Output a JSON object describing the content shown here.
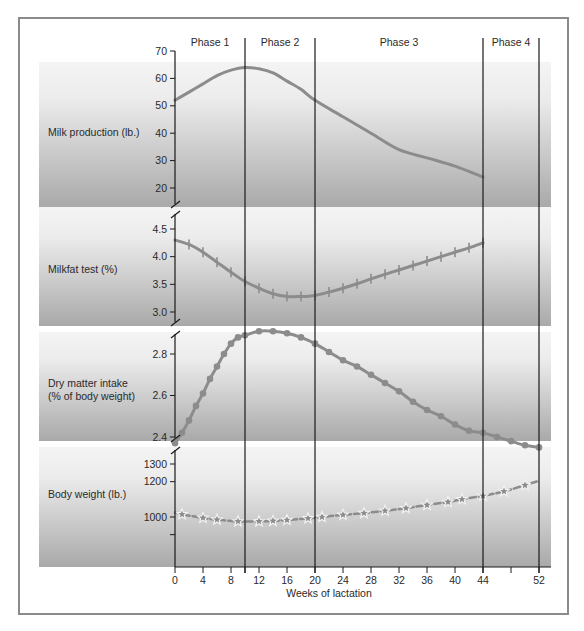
{
  "figure": {
    "x_axis_title": "Weeks of lactation",
    "phases": [
      {
        "label": "Phase 1",
        "start": 0,
        "end": 10
      },
      {
        "label": "Phase 2",
        "start": 10,
        "end": 20
      },
      {
        "label": "Phase 3",
        "start": 20,
        "end": 44
      },
      {
        "label": "Phase 4",
        "start": 44,
        "end": 52
      }
    ],
    "x_ticks": [
      0,
      4,
      8,
      12,
      16,
      20,
      24,
      28,
      32,
      36,
      40,
      44,
      52
    ],
    "panels": [
      {
        "label": "Milk production (lb.)",
        "y_ticks": [
          "70",
          "60",
          "50",
          "40",
          "30",
          "20"
        ]
      },
      {
        "label": "Milkfat test (%)",
        "y_ticks": [
          "4.5",
          "4.0",
          "3.5",
          "3.0"
        ]
      },
      {
        "label_line1": "Dry matter intake",
        "label_line2": "(% of body weight)",
        "y_ticks": [
          "2.8",
          "2.6",
          "2.4"
        ]
      },
      {
        "label": "Body weight (lb.)",
        "y_ticks": [
          "1300",
          "1200",
          "1000"
        ]
      }
    ]
  },
  "colors": {
    "line": "#8c8c8c",
    "axis": "#1a1a1a",
    "panel_top": "#f4f4f4",
    "panel_bottom": "#a9a9a9",
    "frame": "#8a8a8a"
  },
  "chart_data": [
    {
      "type": "line",
      "title": "Milk production (lb.)",
      "xlabel": "Weeks of lactation",
      "ylabel": "Milk production (lb.)",
      "ylim": [
        15,
        70
      ],
      "y_ticks": [
        20,
        30,
        40,
        50,
        60,
        70
      ],
      "marker": "none",
      "x": [
        0,
        2,
        4,
        6,
        8,
        10,
        12,
        14,
        16,
        18,
        20,
        24,
        28,
        32,
        36,
        40,
        44
      ],
      "values": [
        52,
        55,
        58,
        61,
        63,
        64,
        63.5,
        62,
        59,
        56,
        52,
        46,
        40,
        34,
        31,
        28,
        24
      ]
    },
    {
      "type": "line",
      "title": "Milkfat test (%)",
      "xlabel": "Weeks of lactation",
      "ylabel": "Milkfat test (%)",
      "ylim": [
        2.8,
        4.75
      ],
      "y_ticks": [
        3.0,
        3.5,
        4.0,
        4.5
      ],
      "marker": "cross",
      "x": [
        0,
        2,
        4,
        6,
        8,
        10,
        12,
        14,
        16,
        18,
        20,
        22,
        24,
        26,
        28,
        30,
        32,
        34,
        36,
        38,
        40,
        42,
        44
      ],
      "values": [
        4.3,
        4.22,
        4.08,
        3.9,
        3.72,
        3.55,
        3.43,
        3.33,
        3.28,
        3.28,
        3.3,
        3.36,
        3.43,
        3.51,
        3.6,
        3.68,
        3.76,
        3.84,
        3.92,
        4.0,
        4.08,
        4.16,
        4.25
      ]
    },
    {
      "type": "line",
      "title": "Dry matter intake (% of body weight)",
      "xlabel": "Weeks of lactation",
      "ylabel": "Dry matter intake (% of body weight)",
      "ylim": [
        2.33,
        2.95
      ],
      "y_ticks": [
        2.4,
        2.6,
        2.8
      ],
      "marker": "circle",
      "x": [
        0,
        1,
        2,
        3,
        4,
        5,
        6,
        7,
        8,
        9,
        10,
        12,
        14,
        16,
        18,
        20,
        22,
        24,
        26,
        28,
        30,
        32,
        34,
        36,
        38,
        40,
        42,
        44,
        46,
        48,
        50,
        52
      ],
      "values": [
        2.37,
        2.42,
        2.48,
        2.55,
        2.61,
        2.68,
        2.74,
        2.8,
        2.85,
        2.88,
        2.89,
        2.91,
        2.91,
        2.9,
        2.88,
        2.85,
        2.81,
        2.77,
        2.74,
        2.7,
        2.66,
        2.62,
        2.57,
        2.53,
        2.5,
        2.46,
        2.43,
        2.42,
        2.4,
        2.38,
        2.36,
        2.35
      ]
    },
    {
      "type": "line",
      "title": "Body weight (lb.)",
      "xlabel": "Weeks of lactation",
      "ylabel": "Body weight (lb.)",
      "ylim": [
        820,
        1330
      ],
      "y_ticks": [
        1000,
        1100,
        1200,
        1300
      ],
      "marker": "star",
      "line_style": "dashed",
      "x": [
        0,
        1,
        4,
        6,
        9,
        12,
        14,
        16,
        19,
        21,
        24,
        27,
        30,
        33,
        36,
        39,
        41,
        44,
        47,
        50,
        52
      ],
      "values": [
        1025,
        1015,
        995,
        985,
        975,
        975,
        978,
        983,
        992,
        1000,
        1012,
        1022,
        1035,
        1050,
        1068,
        1085,
        1100,
        1120,
        1145,
        1180,
        1205,
        1225,
        1260
      ]
    }
  ]
}
